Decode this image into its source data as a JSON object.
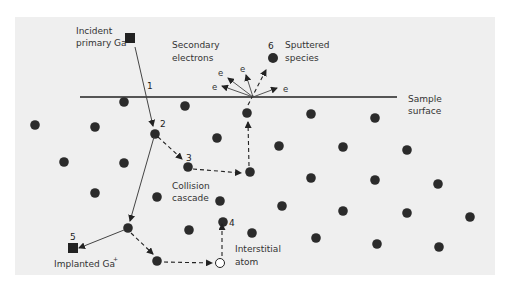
{
  "diagram": {
    "labels": {
      "incident": [
        "Incident",
        "primary Ga"
      ],
      "incident_sup": "+",
      "secondary": [
        "Secondary",
        "electrons"
      ],
      "sputtered": [
        "Sputtered",
        "species"
      ],
      "surface": [
        "Sample",
        "surface"
      ],
      "cascade": [
        "Collision",
        "cascade"
      ],
      "interstitial": [
        "Interstitial",
        "atom"
      ],
      "implanted": "Implanted Ga",
      "implanted_sup": "+",
      "electron": "e"
    },
    "step_numbers": [
      "1",
      "2",
      "3",
      "4",
      "5",
      "6"
    ],
    "colors": {
      "panel": "#efefef",
      "atom": "#2b2b2b",
      "line": "#222222",
      "text": "#333333"
    }
  }
}
